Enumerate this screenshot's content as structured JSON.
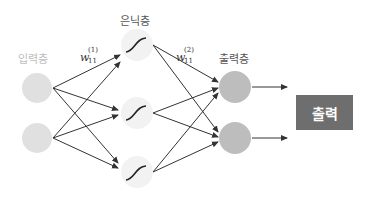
{
  "diagram": {
    "layers": {
      "input": {
        "label": "입력층",
        "nodes": 2
      },
      "hidden": {
        "label": "은닉층",
        "nodes": 3,
        "activation": "sigmoid-curve"
      },
      "output": {
        "label": "출력층",
        "nodes": 2
      }
    },
    "weights": {
      "first": {
        "symbol": "w",
        "superscript": "(1)",
        "subscript": "11"
      },
      "second": {
        "symbol": "w",
        "superscript": "(2)",
        "subscript": "11"
      }
    },
    "result_box": {
      "label": "출력"
    },
    "colors": {
      "input_node": "#e0e0e0",
      "hidden_node": "#f2f2f2",
      "output_node": "#bdbdbd",
      "result_box": "#6e6e6e",
      "edge": "#333333"
    }
  }
}
